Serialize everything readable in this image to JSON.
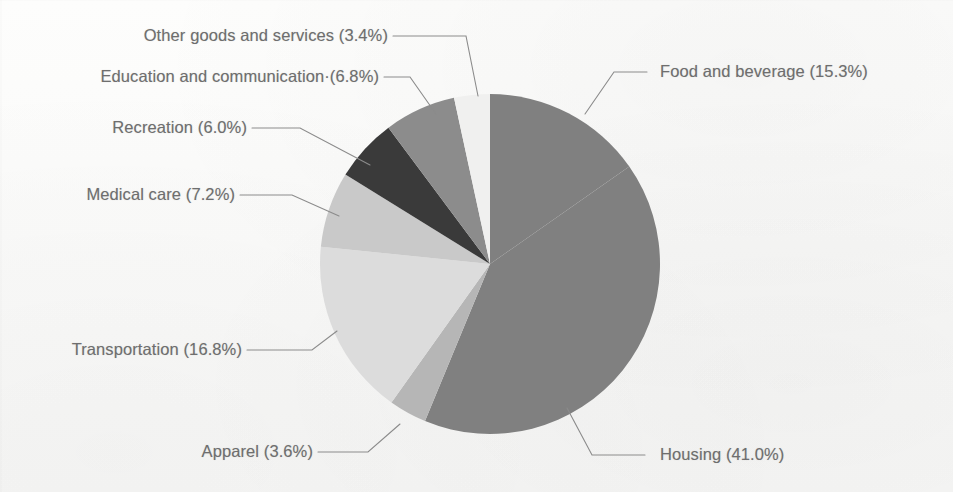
{
  "figure": {
    "type": "pie-chart",
    "background_color": "#fbfbfa",
    "label_color": "#6e6e6e",
    "leader_line_color": "#8b8b8b"
  },
  "chart_data": {
    "type": "pie",
    "title": "",
    "subtitle": "",
    "xlabel": "",
    "ylabel": "",
    "grid": false,
    "legend_position": "callout-labels",
    "units": "percent",
    "start_angle_deg": 0,
    "direction": "clockwise",
    "total": 100.1,
    "categories": [
      "Food and beverage",
      "Housing",
      "Apparel",
      "Transportation",
      "Medical care",
      "Recreation",
      "Education and communication",
      "Other goods and services"
    ],
    "values": [
      15.3,
      41.0,
      3.6,
      16.8,
      7.2,
      6.0,
      6.8,
      3.4
    ],
    "colors": [
      "#808080",
      "#808080",
      "#b6b6b6",
      "#dcdcdc",
      "#c9c9c9",
      "#3a3a3a",
      "#8c8c8c",
      "#f0f0ef"
    ],
    "slices": [
      {
        "label": "Food and beverage",
        "value": 15.3,
        "label_text": "Food and beverage (15.3%)",
        "color": "#808080"
      },
      {
        "label": "Housing",
        "value": 41.0,
        "label_text": "Housing (41.0%)",
        "color": "#808080"
      },
      {
        "label": "Apparel",
        "value": 3.6,
        "label_text": "Apparel (3.6%)",
        "color": "#b6b6b6"
      },
      {
        "label": "Transportation",
        "value": 16.8,
        "label_text": "Transportation (16.8%)",
        "color": "#dcdcdc"
      },
      {
        "label": "Medical care",
        "value": 7.2,
        "label_text": "Medical care (7.2%)",
        "color": "#c9c9c9"
      },
      {
        "label": "Recreation",
        "value": 6.0,
        "label_text": "Recreation (6.0%)",
        "color": "#3a3a3a"
      },
      {
        "label": "Education and communication",
        "value": 6.8,
        "label_text": "Education and communication·(6.8%)",
        "color": "#8c8c8c"
      },
      {
        "label": "Other goods and services",
        "value": 3.4,
        "label_text": "Other goods and services (3.4%)",
        "color": "#f0f0ef"
      }
    ]
  },
  "labels": {
    "other_goods_and_services": "Other goods and services (3.4%)",
    "education_and_communication": "Education and communication·(6.8%)",
    "recreation": "Recreation (6.0%)",
    "medical_care": "Medical care (7.2%)",
    "transportation": "Transportation (16.8%)",
    "apparel": "Apparel (3.6%)",
    "housing": "Housing (41.0%)",
    "food_and_beverage": "Food and beverage (15.3%)"
  }
}
